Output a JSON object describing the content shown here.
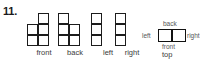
{
  "problem": {
    "number": "11."
  },
  "elevation_views": [
    {
      "label": "front",
      "left": 0,
      "cells": [
        {
          "col": 1,
          "row": 0
        },
        {
          "col": 0,
          "row": 1
        },
        {
          "col": 1,
          "row": 1
        },
        {
          "col": 0,
          "row": 2
        },
        {
          "col": 1,
          "row": 2
        }
      ]
    },
    {
      "label": "back",
      "left": 31,
      "cells": [
        {
          "col": 0,
          "row": 0
        },
        {
          "col": 0,
          "row": 1
        },
        {
          "col": 1,
          "row": 1
        },
        {
          "col": 0,
          "row": 2
        },
        {
          "col": 1,
          "row": 2
        }
      ]
    },
    {
      "label": "left",
      "left": 64,
      "cells": [
        {
          "col": 0,
          "row": 0
        },
        {
          "col": 0,
          "row": 1
        },
        {
          "col": 0,
          "row": 2
        }
      ]
    },
    {
      "label": "right",
      "left": 88,
      "cells": [
        {
          "col": 0,
          "row": 0
        },
        {
          "col": 0,
          "row": 1
        },
        {
          "col": 0,
          "row": 2
        }
      ]
    }
  ],
  "top_view": {
    "cells": 2,
    "labels": {
      "back": "back",
      "front": "front",
      "left": "left",
      "right": "right",
      "caption": "top"
    }
  },
  "colors": {
    "ink": "#1c1c1c",
    "label": "#3a3a3a",
    "background": "#ffffff"
  }
}
